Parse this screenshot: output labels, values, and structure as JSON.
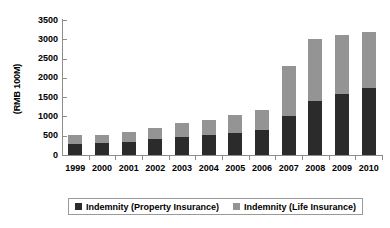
{
  "chart_data": {
    "type": "bar",
    "subtype": "stacked-vertical",
    "title": "",
    "xlabel": "",
    "ylabel": "(RMB 100M)",
    "ylim": [
      0,
      3500
    ],
    "ytick_step": 500,
    "yticks": [
      0,
      500,
      1000,
      1500,
      2000,
      2500,
      3000,
      3500
    ],
    "ytick_labels": [
      "0",
      "500",
      "1000",
      "1500",
      "2000",
      "2500",
      "3000",
      "3500"
    ],
    "grid": false,
    "legend_position": "bottom",
    "categories": [
      "1999",
      "2000",
      "2001",
      "2002",
      "2003",
      "2004",
      "2005",
      "2006",
      "2007",
      "2008",
      "2009",
      "2010"
    ],
    "series": [
      {
        "name": "Indemnity (Property Insurance)",
        "color": "#2b2b2b",
        "values": [
          280,
          300,
          350,
          410,
          480,
          510,
          570,
          660,
          1000,
          1400,
          1580,
          1750
        ]
      },
      {
        "name": "Indemnity (Life Insurance)",
        "color": "#949494",
        "values": [
          230,
          220,
          240,
          280,
          340,
          400,
          470,
          520,
          1300,
          1600,
          1520,
          1450
        ]
      }
    ],
    "totals": [
      510,
      520,
      590,
      690,
      820,
      910,
      1040,
      1180,
      2300,
      3000,
      3100,
      3200
    ]
  },
  "axes": {
    "y_title": "(RMB 100M)"
  },
  "legend": {
    "entries": [
      {
        "label": "Indemnity (Property Insurance)",
        "color": "#2b2b2b",
        "swatch": "property"
      },
      {
        "label": "Indemnity (Life Insurance)",
        "color": "#949494",
        "swatch": "life"
      }
    ]
  },
  "colors": {
    "property": "#2b2b2b",
    "life": "#949494",
    "axis": "#8c8c8c",
    "background": "#ffffff",
    "text": "#000000"
  }
}
